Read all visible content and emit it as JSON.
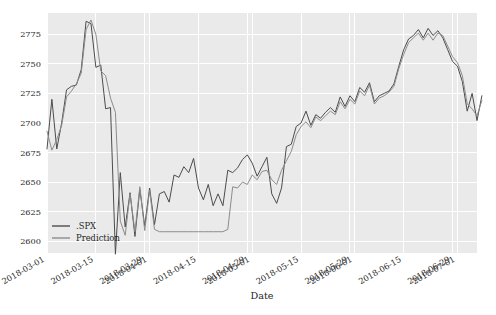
{
  "figure": {
    "width": 496,
    "height": 315,
    "background_color": "#ffffff",
    "plot_background_color": "#eaeaea",
    "grid_color": "#ffffff"
  },
  "chart_data": {
    "type": "line",
    "title": "",
    "xlabel": "Date",
    "ylabel": "",
    "grid": true,
    "legend_position": "lower left",
    "ylim": [
      2590,
      2793
    ],
    "yticks": [
      2600,
      2625,
      2650,
      2675,
      2700,
      2725,
      2750,
      2775
    ],
    "ytick_labels": [
      "2600",
      "2625",
      "2650",
      "2675",
      "2700",
      "2725",
      "2750",
      "2775"
    ],
    "xtick_labels": [
      "2018-03-01",
      "2018-03-15",
      "2018-03-29",
      "2018-04-01",
      "2018-04-15",
      "2018-04-29",
      "2018-05-01",
      "2018-05-15",
      "2018-05-29",
      "2018-06-01",
      "2018-06-15",
      "2018-06-29",
      "2018-07-01"
    ],
    "xtick_positions": [
      0,
      10,
      20,
      21,
      31,
      41,
      42,
      52,
      62,
      63,
      73,
      83,
      84
    ],
    "x_range": [
      0,
      88
    ],
    "series": [
      {
        "name": ".SPX",
        "color": "#4c4c4c",
        "linewidth": 1.0,
        "values": [
          2678,
          2720,
          2678,
          2700,
          2728,
          2731,
          2732,
          2745,
          2786,
          2784,
          2747,
          2749,
          2712,
          2713,
          2589,
          2658,
          2612,
          2641,
          2604,
          2644,
          2613,
          2645,
          2614,
          2640,
          2642,
          2633,
          2656,
          2654,
          2663,
          2658,
          2670,
          2645,
          2635,
          2648,
          2630,
          2640,
          2630,
          2660,
          2658,
          2662,
          2669,
          2673,
          2666,
          2655,
          2663,
          2671,
          2640,
          2632,
          2645,
          2680,
          2682,
          2697,
          2700,
          2710,
          2698,
          2707,
          2704,
          2709,
          2713,
          2709,
          2722,
          2714,
          2723,
          2718,
          2730,
          2726,
          2734,
          2718,
          2723,
          2725,
          2727,
          2733,
          2748,
          2762,
          2771,
          2774,
          2779,
          2772,
          2780,
          2774,
          2778,
          2772,
          2762,
          2752,
          2748,
          2735,
          2710,
          2725,
          2702,
          2723
        ]
      },
      {
        "name": "Prediction",
        "color": "#8c8c8c",
        "linewidth": 1.0,
        "values": [
          2693,
          2677,
          2686,
          2698,
          2722,
          2727,
          2733,
          2742,
          2779,
          2787,
          2775,
          2744,
          2740,
          2721,
          2709,
          2617,
          2605,
          2640,
          2608,
          2646,
          2609,
          2643,
          2610,
          2608,
          2608,
          2608,
          2608,
          2608,
          2608,
          2608,
          2608,
          2608,
          2608,
          2608,
          2608,
          2608,
          2608,
          2610,
          2646,
          2645,
          2650,
          2648,
          2656,
          2652,
          2659,
          2660,
          2652,
          2648,
          2660,
          2668,
          2676,
          2690,
          2697,
          2701,
          2696,
          2705,
          2702,
          2706,
          2710,
          2707,
          2718,
          2712,
          2720,
          2716,
          2727,
          2723,
          2732,
          2716,
          2721,
          2723,
          2726,
          2731,
          2746,
          2758,
          2768,
          2772,
          2776,
          2770,
          2776,
          2770,
          2776,
          2774,
          2765,
          2756,
          2751,
          2740,
          2716,
          2712,
          2706,
          2719
        ]
      }
    ]
  },
  "legend": {
    "items": [
      {
        "label": ".SPX",
        "color": "#4c4c4c"
      },
      {
        "label": "Prediction",
        "color": "#8c8c8c"
      }
    ]
  }
}
